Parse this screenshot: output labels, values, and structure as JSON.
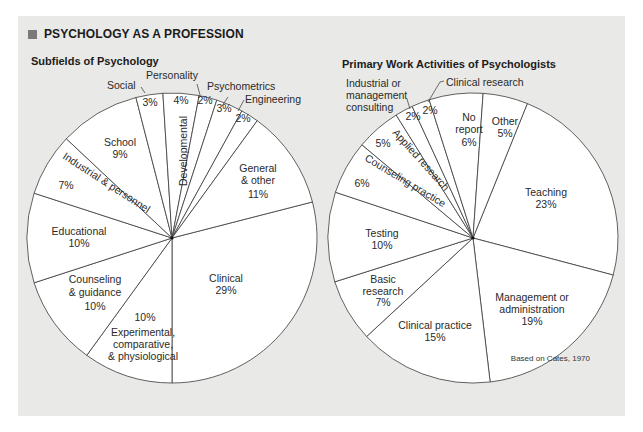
{
  "header": {
    "title": "PSYCHOLOGY AS A PROFESSION",
    "marker_color": "#7a7a7a",
    "panel_color": "#e9e9e7"
  },
  "source_note": "Based on Cates, 1970",
  "chart_data": [
    {
      "type": "pie",
      "title": "Subfields of Psychology",
      "start_angle_deg_clockwise_from_top": 75.6,
      "slices": [
        {
          "label": "Clinical",
          "value": 29,
          "display": "29%"
        },
        {
          "label": "Experimental, comparative, & physiological",
          "value": 10,
          "display": "10%"
        },
        {
          "label": "Counseling & guidance",
          "value": 10,
          "display": "10%"
        },
        {
          "label": "Educational",
          "value": 10,
          "display": "10%"
        },
        {
          "label": "Industrial & personnel",
          "value": 7,
          "display": "7%"
        },
        {
          "label": "School",
          "value": 9,
          "display": "9%"
        },
        {
          "label": "Social",
          "value": 3,
          "display": "3%"
        },
        {
          "label": "Developmental",
          "value": 4,
          "display": "4%"
        },
        {
          "label": "Personality",
          "value": 2,
          "display": "2%"
        },
        {
          "label": "Psychometrics",
          "value": 3,
          "display": "3%"
        },
        {
          "label": "Engineering",
          "value": 2,
          "display": "2%"
        },
        {
          "label": "General & other",
          "value": 11,
          "display": "11%"
        }
      ]
    },
    {
      "type": "pie",
      "title": "Primary Work Activities of Psychologists",
      "start_angle_deg_clockwise_from_top": 22,
      "slices": [
        {
          "label": "Teaching",
          "value": 23,
          "display": "23%"
        },
        {
          "label": "Management or administration",
          "value": 19,
          "display": "19%"
        },
        {
          "label": "Clinical practice",
          "value": 15,
          "display": "15%"
        },
        {
          "label": "Basic research",
          "value": 7,
          "display": "7%"
        },
        {
          "label": "Testing",
          "value": 10,
          "display": "10%"
        },
        {
          "label": "Counseling practice",
          "value": 6,
          "display": "6%"
        },
        {
          "label": "Applied research",
          "value": 5,
          "display": "5%"
        },
        {
          "label": "Industrial or management consulting",
          "value": 2,
          "display": "2%"
        },
        {
          "label": "Clinical research",
          "value": 2,
          "display": "2%"
        },
        {
          "label": "No report",
          "value": 6,
          "display": "6%"
        },
        {
          "label": "Other",
          "value": 5,
          "display": "5%"
        }
      ]
    }
  ],
  "left_labels": {
    "social": "Social",
    "social_pct": "3%",
    "personality": "Personality",
    "personality_pct": "2%",
    "developmental": "Developmental",
    "developmental_pct": "4%",
    "psychometrics": "Psychometrics",
    "psychometrics_pct": "3%",
    "engineering": "Engineering",
    "engineering_pct": "2%",
    "general_1": "General",
    "general_2": "& other",
    "general_pct": "11%",
    "school": "School",
    "school_pct": "9%",
    "industrial": "Industrial & personnel",
    "industrial_pct": "7%",
    "educational": "Educational",
    "educational_pct": "10%",
    "counseling_1": "Counseling",
    "counseling_2": "& guidance",
    "counseling_pct": "10%",
    "experimental_pct": "10%",
    "experimental_1": "Experimental,",
    "experimental_2": "comparative,",
    "experimental_3": "& physiological",
    "clinical": "Clinical",
    "clinical_pct": "29%"
  },
  "right_labels": {
    "industrial_1": "Industrial or",
    "industrial_2": "management",
    "industrial_3": "consulting",
    "industrial_pct": "2%",
    "clinical_research": "Clinical research",
    "clinical_research_pct": "2%",
    "no_report_1": "No",
    "no_report_2": "report",
    "no_report_pct": "6%",
    "other": "Other",
    "other_pct": "5%",
    "teaching": "Teaching",
    "teaching_pct": "23%",
    "applied": "Applied research",
    "applied_pct": "5%",
    "counseling": "Counseling practice",
    "counseling_pct": "6%",
    "testing": "Testing",
    "testing_pct": "10%",
    "basic_1": "Basic",
    "basic_2": "research",
    "basic_pct": "7%",
    "clinical_practice": "Clinical practice",
    "clinical_practice_pct": "15%",
    "management_1": "Management or",
    "management_2": "administration",
    "management_pct": "19%"
  }
}
